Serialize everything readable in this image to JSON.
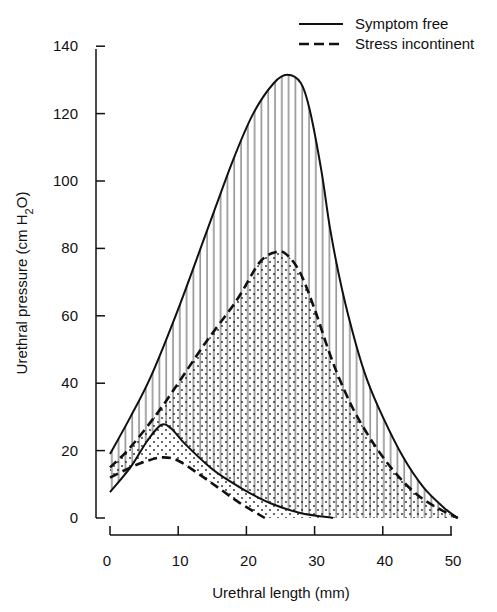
{
  "chart_data": {
    "type": "line",
    "title": "",
    "xlabel": "Urethral length (mm)",
    "ylabel": "Urethral pressure (cm H2O)",
    "ylabel_parts": {
      "pre": "Urethral pressure (cm H",
      "sub": "2",
      "post": "O)"
    },
    "xlim": [
      0,
      51
    ],
    "ylim": [
      0,
      140
    ],
    "xticks": [
      0,
      10,
      20,
      30,
      40,
      50
    ],
    "yticks": [
      0,
      20,
      40,
      60,
      80,
      100,
      120,
      140
    ],
    "grid": false,
    "legend_position": "top-right",
    "legend": [
      {
        "label": "Symptom free",
        "style": "solid"
      },
      {
        "label": "Stress incontinent",
        "style": "dashed"
      }
    ],
    "series": [
      {
        "name": "Symptom free (maximum)",
        "style": "solid",
        "fill": "vertical-hatch",
        "points": [
          [
            0,
            19
          ],
          [
            3,
            30
          ],
          [
            6,
            42
          ],
          [
            10,
            62
          ],
          [
            14,
            84
          ],
          [
            18,
            106
          ],
          [
            21,
            120
          ],
          [
            24,
            129
          ],
          [
            26,
            131.5
          ],
          [
            28,
            129
          ],
          [
            29.3,
            121
          ],
          [
            31,
            103
          ],
          [
            32.3,
            85.5
          ],
          [
            34,
            68
          ],
          [
            36,
            52
          ],
          [
            37.7,
            41
          ],
          [
            40,
            30
          ],
          [
            43,
            18
          ],
          [
            46,
            9
          ],
          [
            49,
            3
          ],
          [
            51,
            0
          ]
        ]
      },
      {
        "name": "Stress incontinent (maximum)",
        "style": "dashed",
        "fill": "dotted",
        "points": [
          [
            0,
            15
          ],
          [
            3,
            21
          ],
          [
            6.9,
            31
          ],
          [
            10,
            40
          ],
          [
            14,
            52
          ],
          [
            18.6,
            64.7
          ],
          [
            22,
            76
          ],
          [
            24.5,
            79
          ],
          [
            26,
            78
          ],
          [
            27.9,
            72.7
          ],
          [
            30,
            62
          ],
          [
            32,
            50
          ],
          [
            33.7,
            41
          ],
          [
            36,
            31
          ],
          [
            39,
            21
          ],
          [
            42,
            13
          ],
          [
            45,
            7
          ],
          [
            48,
            3
          ],
          [
            51,
            0
          ]
        ]
      },
      {
        "name": "Symptom free (minimum)",
        "style": "solid",
        "points": [
          [
            0,
            7.7
          ],
          [
            3,
            15
          ],
          [
            5.5,
            23
          ],
          [
            7.5,
            27.6
          ],
          [
            9,
            26.5
          ],
          [
            11,
            22
          ],
          [
            14.7,
            15
          ],
          [
            17.5,
            11
          ],
          [
            20.5,
            7.4
          ],
          [
            24,
            4
          ],
          [
            27.9,
            1.5
          ],
          [
            32.7,
            0
          ]
        ]
      },
      {
        "name": "Stress incontinent (minimum)",
        "style": "dashed",
        "points": [
          [
            0,
            12
          ],
          [
            3,
            15
          ],
          [
            5.5,
            17
          ],
          [
            7.8,
            18
          ],
          [
            10,
            17
          ],
          [
            13.2,
            12.8
          ],
          [
            16,
            8.8
          ],
          [
            19,
            4.5
          ],
          [
            22.7,
            0
          ]
        ]
      }
    ]
  }
}
